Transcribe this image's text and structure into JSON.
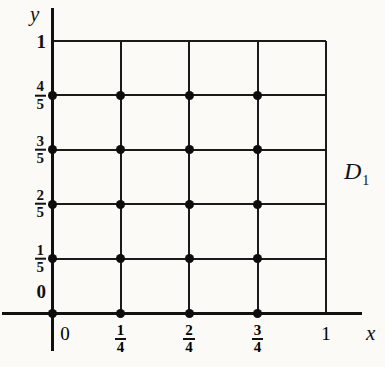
{
  "figure": {
    "type": "lattice-grid-diagram",
    "region_label": "D",
    "region_label_subscript": "1",
    "axis_x_name": "x",
    "axis_y_name": "y"
  },
  "chart_data": {
    "type": "scatter",
    "title": "",
    "xlabel": "x",
    "ylabel": "y",
    "grid": true,
    "legend": null,
    "xlim": [
      0,
      1
    ],
    "ylim": [
      0,
      1
    ],
    "x_ticks": [
      {
        "value": 0,
        "label": "0",
        "kind": "integer"
      },
      {
        "value": 0.25,
        "label": "1/4",
        "kind": "fraction",
        "num": "1",
        "den": "4"
      },
      {
        "value": 0.5,
        "label": "2/4",
        "kind": "fraction",
        "num": "2",
        "den": "4"
      },
      {
        "value": 0.75,
        "label": "3/4",
        "kind": "fraction",
        "num": "3",
        "den": "4"
      },
      {
        "value": 1,
        "label": "1",
        "kind": "integer"
      }
    ],
    "y_ticks": [
      {
        "value": 0,
        "label": "0",
        "kind": "integer"
      },
      {
        "value": 0.2,
        "label": "1/5",
        "kind": "fraction",
        "num": "1",
        "den": "5"
      },
      {
        "value": 0.4,
        "label": "2/5",
        "kind": "fraction",
        "num": "2",
        "den": "5"
      },
      {
        "value": 0.6,
        "label": "3/5",
        "kind": "fraction",
        "num": "3",
        "den": "5"
      },
      {
        "value": 0.8,
        "label": "4/5",
        "kind": "fraction",
        "num": "4",
        "den": "5"
      },
      {
        "value": 1,
        "label": "1",
        "kind": "integer"
      }
    ],
    "points_x": [
      0,
      0.25,
      0.5,
      0.75
    ],
    "points_y": [
      0,
      0.2,
      0.4,
      0.6,
      0.8
    ],
    "points": [
      {
        "x": 0,
        "y": 0
      },
      {
        "x": 0.25,
        "y": 0
      },
      {
        "x": 0.5,
        "y": 0
      },
      {
        "x": 0.75,
        "y": 0
      },
      {
        "x": 0,
        "y": 0.2
      },
      {
        "x": 0.25,
        "y": 0.2
      },
      {
        "x": 0.5,
        "y": 0.2
      },
      {
        "x": 0.75,
        "y": 0.2
      },
      {
        "x": 0,
        "y": 0.4
      },
      {
        "x": 0.25,
        "y": 0.4
      },
      {
        "x": 0.5,
        "y": 0.4
      },
      {
        "x": 0.75,
        "y": 0.4
      },
      {
        "x": 0,
        "y": 0.6
      },
      {
        "x": 0.25,
        "y": 0.6
      },
      {
        "x": 0.5,
        "y": 0.6
      },
      {
        "x": 0.75,
        "y": 0.6
      },
      {
        "x": 0,
        "y": 0.8
      },
      {
        "x": 0.25,
        "y": 0.8
      },
      {
        "x": 0.5,
        "y": 0.8
      },
      {
        "x": 0.75,
        "y": 0.8
      }
    ],
    "colors": {
      "point": "#0d0d0d",
      "grid": "#1a1a1a",
      "axis": "#111111",
      "background": "#fbfaf7"
    }
  }
}
